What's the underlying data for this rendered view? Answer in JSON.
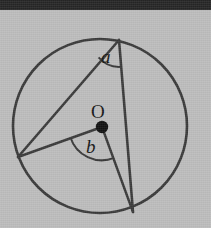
{
  "figure": {
    "background_color": "#bdbdbd",
    "top_band_color": "#262626",
    "stroke_color": "#3a3a3a",
    "label_color": "#151515",
    "labels": {
      "inscribed_angle": "a",
      "central_angle": "b",
      "center_point": "O"
    },
    "circle": {
      "center_x": 100,
      "center_y": 126,
      "radius": 87
    },
    "points": {
      "A": {
        "x": 119,
        "y": 40,
        "role": "apex-top-right"
      },
      "B": {
        "x": 18,
        "y": 157,
        "role": "vertex-left"
      },
      "C": {
        "x": 133,
        "y": 212,
        "role": "vertex-bottom"
      },
      "O": {
        "x": 102,
        "y": 127,
        "role": "center"
      }
    },
    "segments": [
      {
        "name": "chord-A-B",
        "from": "A",
        "to": "B"
      },
      {
        "name": "chord-A-C",
        "from": "A",
        "to": "C"
      },
      {
        "name": "radius-O-B",
        "from": "O",
        "to": "B"
      },
      {
        "name": "radius-O-C",
        "from": "O",
        "to": "C"
      }
    ],
    "arcs": [
      {
        "name": "angle-arc-a",
        "at": "A",
        "radius": 26
      },
      {
        "name": "angle-arc-b",
        "at": "O",
        "radius": 33
      }
    ]
  }
}
